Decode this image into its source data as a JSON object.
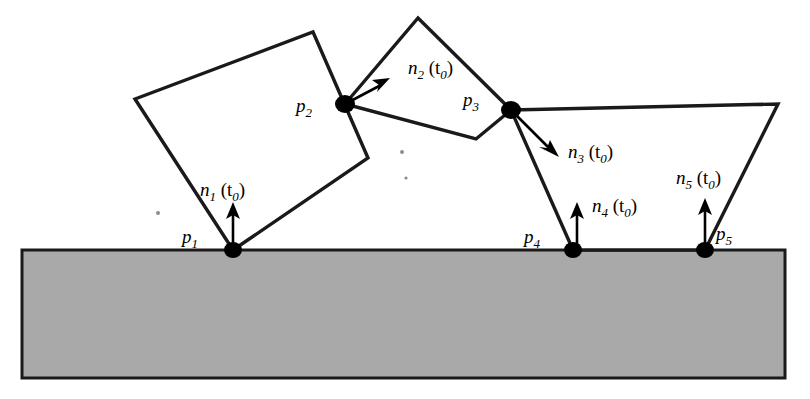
{
  "figure": {
    "canvas": {
      "width": 810,
      "height": 399
    },
    "colors": {
      "ground_fill": "#a9a9a9",
      "outline": "#1a1a1a",
      "dot": "#000000",
      "background": "#ffffff"
    }
  },
  "ground": {
    "name": "ground-block",
    "x": 22,
    "y": 250,
    "width": 763,
    "height": 128
  },
  "bodies": [
    {
      "name": "body-left-quad",
      "points": "233,250 135,99 313,32 368,158"
    },
    {
      "name": "body-middle-quad",
      "points": "345,104 418,18 511,110 476,139"
    },
    {
      "name": "body-right-trapezoid",
      "points": "511,110 778,104 705,250 573,250"
    }
  ],
  "contacts": [
    {
      "name": "contact-point-p1",
      "label": "p",
      "sub": "1",
      "cx": 233,
      "cy": 250,
      "rx": 9,
      "ry": 8,
      "label_x": 182,
      "label_y": 243
    },
    {
      "name": "contact-point-p2",
      "label": "p",
      "sub": "2",
      "cx": 345,
      "cy": 104,
      "rx": 10,
      "ry": 9,
      "label_x": 296,
      "label_y": 112
    },
    {
      "name": "contact-point-p3",
      "label": "p",
      "sub": "3",
      "cx": 511,
      "cy": 110,
      "rx": 10,
      "ry": 9,
      "label_x": 463,
      "label_y": 106
    },
    {
      "name": "contact-point-p4",
      "label": "p",
      "sub": "4",
      "cx": 573,
      "cy": 250,
      "rx": 9,
      "ry": 8,
      "label_x": 524,
      "label_y": 243
    },
    {
      "name": "contact-point-p5",
      "label": "p",
      "sub": "5",
      "cx": 705,
      "cy": 250,
      "rx": 9,
      "ry": 8,
      "label_x": 716,
      "label_y": 240
    }
  ],
  "normals": [
    {
      "name": "normal-arrow-n1",
      "label": "n",
      "sub": "1",
      "arg": "(t",
      "arg_sub": "0",
      "arg_close": ")",
      "x1": 233,
      "y1": 248,
      "x2": 233,
      "y2": 212,
      "head": "233,202 226,219 233,215 240,219",
      "label_x": 200,
      "label_y": 196
    },
    {
      "name": "normal-arrow-n2",
      "label": "n",
      "sub": "2",
      "arg": "(t",
      "arg_sub": "0",
      "arg_close": ")",
      "x1": 347,
      "y1": 103,
      "x2": 381,
      "y2": 85,
      "head": "390,78 372,80 379,85 377,92",
      "label_x": 408,
      "label_y": 74
    },
    {
      "name": "normal-arrow-n3",
      "label": "n",
      "sub": "3",
      "arg": "(t",
      "arg_sub": "0",
      "arg_close": ")",
      "x1": 513,
      "y1": 112,
      "x2": 548,
      "y2": 147,
      "head": "559,157 550,140 547,148 539,147",
      "label_x": 568,
      "label_y": 158
    },
    {
      "name": "normal-arrow-n4",
      "label": "n",
      "sub": "4",
      "arg": "(t",
      "arg_sub": "0",
      "arg_close": ")",
      "x1": 577,
      "y1": 248,
      "x2": 577,
      "y2": 212,
      "head": "577,202 570,219 577,215 584,219",
      "label_x": 592,
      "label_y": 212
    },
    {
      "name": "normal-arrow-n5",
      "label": "n",
      "sub": "5",
      "arg": "(t",
      "arg_sub": "0",
      "arg_close": ")",
      "x1": 705,
      "y1": 248,
      "x2": 705,
      "y2": 208,
      "head": "705,198 698,215 705,211 712,215",
      "label_x": 676,
      "label_y": 184
    }
  ],
  "specks": [
    {
      "name": "speck-mark-1",
      "cx": 158,
      "cy": 213,
      "r": 2
    },
    {
      "name": "speck-mark-2",
      "cx": 402,
      "cy": 152,
      "r": 2
    },
    {
      "name": "speck-mark-3",
      "cx": 406,
      "cy": 178,
      "r": 1.6
    }
  ]
}
